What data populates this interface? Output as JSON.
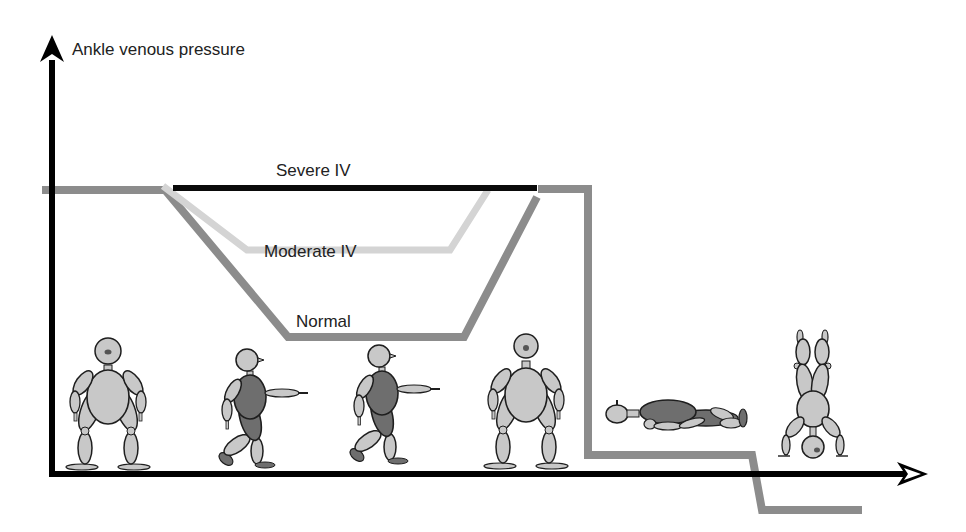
{
  "diagram": {
    "y_axis_label": "Ankle venous pressure",
    "x_axis_label": "",
    "curves": [
      {
        "id": "normal",
        "label": "Normal",
        "color": "#8c8c8c"
      },
      {
        "id": "moderate",
        "label": "Moderate IV",
        "color": "#d4d4d4"
      },
      {
        "id": "severe",
        "label": "Severe IV",
        "color": "#0a0a0a"
      },
      {
        "id": "posture",
        "label": "",
        "color": "#8c8c8c"
      }
    ],
    "figures": [
      {
        "id": "standing-1",
        "pose": "standing"
      },
      {
        "id": "walking-1",
        "pose": "walking"
      },
      {
        "id": "walking-2",
        "pose": "walking"
      },
      {
        "id": "standing-2",
        "pose": "standing"
      },
      {
        "id": "lying",
        "pose": "supine"
      },
      {
        "id": "handstand",
        "pose": "inverted"
      }
    ],
    "colors": {
      "axis": "#000000",
      "figure_fill_light": "#c8c8c8",
      "figure_fill_dark": "#6e6e6e",
      "figure_outline": "#1e1e1e",
      "background": "#ffffff"
    }
  }
}
